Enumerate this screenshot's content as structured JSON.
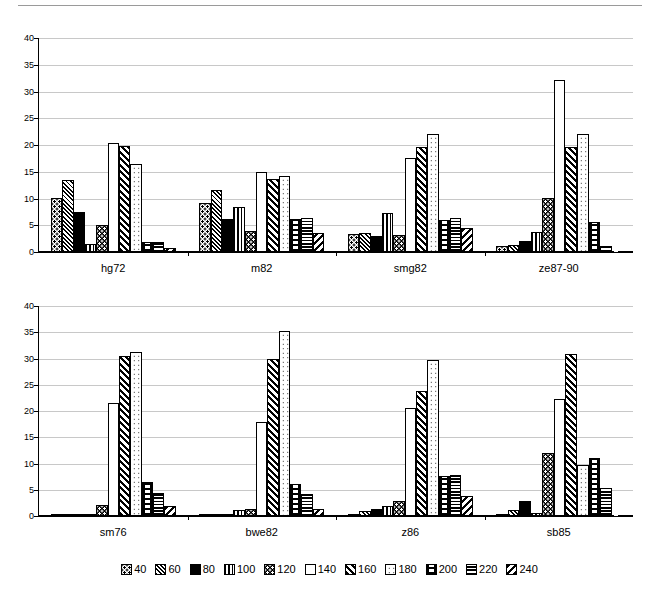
{
  "chart_data": [
    {
      "type": "bar",
      "title": "",
      "xlabel": "",
      "ylabel": "",
      "ylim": [
        0,
        40
      ],
      "yticks": [
        0,
        5,
        10,
        15,
        20,
        25,
        30,
        35,
        40
      ],
      "grid": true,
      "legend_position": "bottom",
      "categories": [
        "hg72",
        "m82",
        "smg82",
        "ze87-90"
      ],
      "series": [
        {
          "name": "40",
          "values": [
            10.1,
            9.1,
            3.3,
            1.2
          ]
        },
        {
          "name": "60",
          "values": [
            13.4,
            11.5,
            3.6,
            1.3
          ]
        },
        {
          "name": "80",
          "values": [
            7.4,
            6.2,
            3.0,
            2.0
          ]
        },
        {
          "name": "100",
          "values": [
            1.5,
            8.5,
            7.2,
            3.8
          ]
        },
        {
          "name": "120",
          "values": [
            5.1,
            4.0,
            3.2,
            10.1
          ]
        },
        {
          "name": "140",
          "values": [
            20.4,
            14.9,
            17.6,
            32.1
          ]
        },
        {
          "name": "160",
          "values": [
            19.8,
            13.7,
            19.7,
            19.7
          ]
        },
        {
          "name": "180",
          "values": [
            16.4,
            14.3,
            22.0,
            22.0
          ]
        },
        {
          "name": "200",
          "values": [
            1.8,
            6.2,
            5.9,
            5.6
          ]
        },
        {
          "name": "220",
          "values": [
            1.9,
            6.4,
            6.3,
            1.1
          ]
        },
        {
          "name": "240",
          "values": [
            0.8,
            3.6,
            4.4,
            0.0
          ]
        }
      ]
    },
    {
      "type": "bar",
      "title": "",
      "xlabel": "",
      "ylabel": "",
      "ylim": [
        0,
        40
      ],
      "yticks": [
        0,
        5,
        10,
        15,
        20,
        25,
        30,
        35,
        40
      ],
      "grid": true,
      "legend_position": "bottom",
      "categories": [
        "sm76",
        "bwe82",
        "z86",
        "sb85"
      ],
      "series": [
        {
          "name": "40",
          "values": [
            0.1,
            0.2,
            0.3,
            0.4
          ]
        },
        {
          "name": "60",
          "values": [
            0.2,
            0.2,
            1.0,
            1.1
          ]
        },
        {
          "name": "80",
          "values": [
            0.1,
            0.2,
            1.4,
            2.9
          ]
        },
        {
          "name": "100",
          "values": [
            0.4,
            1.1,
            2.0,
            0.6
          ]
        },
        {
          "name": "120",
          "values": [
            2.1,
            1.4,
            2.9,
            12.0
          ]
        },
        {
          "name": "140",
          "values": [
            21.5,
            18.0,
            20.6,
            22.3
          ]
        },
        {
          "name": "160",
          "values": [
            30.5,
            30.0,
            23.9,
            30.8
          ]
        },
        {
          "name": "180",
          "values": [
            31.3,
            35.3,
            29.7,
            9.8
          ]
        },
        {
          "name": "200",
          "values": [
            6.4,
            6.1,
            7.7,
            11.0
          ]
        },
        {
          "name": "220",
          "values": [
            4.3,
            4.2,
            7.8,
            5.4
          ]
        },
        {
          "name": "240",
          "values": [
            2.0,
            1.4,
            3.9,
            0.0
          ]
        }
      ]
    }
  ],
  "legend": {
    "entries": [
      {
        "label": "40",
        "pattern": "dotted-grid"
      },
      {
        "label": "60",
        "pattern": "cross-hatch"
      },
      {
        "label": "80",
        "pattern": "solid-black"
      },
      {
        "label": "100",
        "pattern": "vertical-lines"
      },
      {
        "label": "120",
        "pattern": "black-with-white-dots"
      },
      {
        "label": "140",
        "pattern": "white-empty"
      },
      {
        "label": "160",
        "pattern": "diagonal-hatch-up"
      },
      {
        "label": "180",
        "pattern": "sparse-dots"
      },
      {
        "label": "200",
        "pattern": "brick"
      },
      {
        "label": "220",
        "pattern": "horizontal-lines"
      },
      {
        "label": "240",
        "pattern": "diagonal-hatch-down"
      }
    ]
  }
}
